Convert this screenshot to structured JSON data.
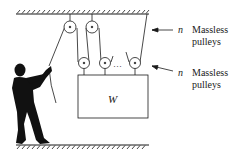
{
  "diagram": {
    "type": "pulley-system",
    "weight_label": "W",
    "labels": [
      {
        "symbol": "n",
        "text_line1": "Massless",
        "text_line2": "pulleys",
        "refers_to": "fixed ceiling pulleys"
      },
      {
        "symbol": "n",
        "text_line1": "Massless",
        "text_line2": "pulleys",
        "refers_to": "movable pulleys on weight"
      }
    ],
    "ellipsis": "…",
    "colors": {
      "line": "#1a1a1a",
      "background": "#ffffff"
    }
  }
}
